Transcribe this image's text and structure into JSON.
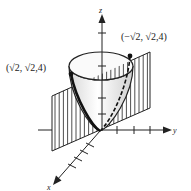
{
  "figure": {
    "axes": {
      "x_label": "x",
      "y_label": "y",
      "z_label": "z"
    },
    "points": [
      {
        "label": "(√2, √2,4)"
      },
      {
        "label": "(−√2, √2,4)"
      }
    ],
    "colors": {
      "ink": "#222222",
      "surface_fill": "#f2f2f2",
      "background": "#ffffff"
    }
  }
}
